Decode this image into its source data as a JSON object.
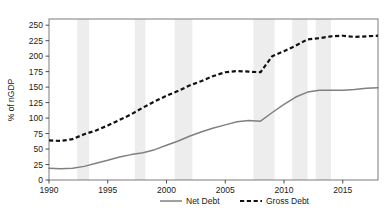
{
  "chart_data": {
    "type": "line",
    "title": "",
    "xlabel": "",
    "ylabel": "% of nGDP",
    "xlim": [
      1990,
      2018
    ],
    "ylim": [
      0,
      260
    ],
    "yticks": [
      0,
      25,
      50,
      75,
      100,
      125,
      150,
      175,
      200,
      225,
      250
    ],
    "xticks": [
      1990,
      1995,
      2000,
      2005,
      2010,
      2015
    ],
    "ytick_labels": [
      "0",
      "25",
      "50",
      "75",
      "100",
      "125",
      "150",
      "175",
      "200",
      "225",
      "250"
    ],
    "xtick_labels": [
      "1990",
      "1995",
      "2000",
      "2005",
      "2010",
      "2015"
    ],
    "grid": false,
    "legend_position": "bottom",
    "x": [
      1990,
      1991,
      1992,
      1993,
      1994,
      1995,
      1996,
      1997,
      1998,
      1999,
      2000,
      2001,
      2002,
      2003,
      2004,
      2005,
      2006,
      2007,
      2008,
      2009,
      2010,
      2011,
      2012,
      2013,
      2014,
      2015,
      2016,
      2017,
      2018
    ],
    "series": [
      {
        "name": "Net Debt",
        "color": "#808080",
        "style": "solid",
        "values": [
          19,
          18,
          19,
          22,
          27,
          32,
          37,
          41,
          44,
          49,
          56,
          63,
          71,
          78,
          84,
          89,
          94,
          96,
          95,
          109,
          122,
          134,
          142,
          145,
          145,
          145,
          146,
          148,
          149
        ]
      },
      {
        "name": "Gross Debt",
        "color": "#111111",
        "style": "dashed",
        "values": [
          64,
          63,
          66,
          74,
          80,
          88,
          97,
          106,
          117,
          127,
          136,
          144,
          153,
          160,
          168,
          174,
          176,
          175,
          174,
          200,
          208,
          217,
          227,
          229,
          232,
          233,
          231,
          232,
          233
        ]
      }
    ],
    "shaded_bands": [
      {
        "start": 1992.4,
        "end": 1993.4,
        "label": "recession"
      },
      {
        "start": 1997.3,
        "end": 1998.2,
        "label": "recession"
      },
      {
        "start": 2000.7,
        "end": 2002.2,
        "label": "recession"
      },
      {
        "start": 2007.4,
        "end": 2009.2,
        "label": "recession"
      },
      {
        "start": 2010.7,
        "end": 2012.0,
        "label": "recession"
      },
      {
        "start": 2012.7,
        "end": 2014.0,
        "label": "recession"
      }
    ],
    "shaded_band_color": "#ededed"
  },
  "legend": {
    "items": [
      {
        "label": "Net Debt",
        "key": "net-debt"
      },
      {
        "label": "Gross Debt",
        "key": "gross-debt"
      }
    ]
  }
}
